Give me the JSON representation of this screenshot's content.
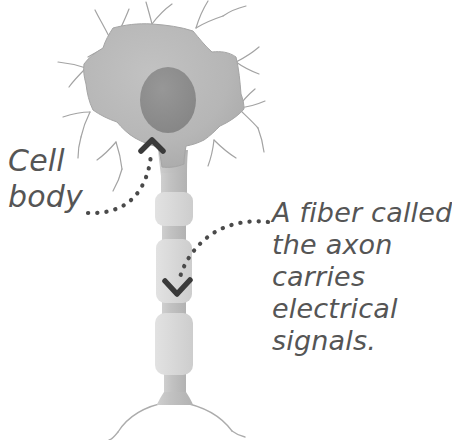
{
  "diagram": {
    "background_color": "#ffffff",
    "labels": {
      "cell_body": {
        "name": "cell-body-label",
        "lines": [
          "Cell",
          "body"
        ],
        "text": "Cell body",
        "color": "#555555",
        "points_to": "soma"
      },
      "axon": {
        "name": "axon-label",
        "lines": [
          "A fiber called",
          "the axon",
          "carries",
          "electrical",
          "signals."
        ],
        "text": "A fiber called the axon carries electrical signals.",
        "color": "#555555",
        "points_to": "axon"
      }
    },
    "parts": {
      "soma": {
        "label": "cell body",
        "fill_color": "#b6b6b6",
        "outline_color": "#9a9a9a"
      },
      "nucleus": {
        "label": "nucleus",
        "fill_color": "#8c8c8c"
      },
      "dendrites": {
        "label": "dendrites",
        "stroke_color": "#a0a0a0"
      },
      "axon": {
        "label": "axon",
        "fill_color": "#c2c2c2"
      },
      "myelin_sheath": {
        "label": "myelin sheath segments",
        "fill_color": "#dadada",
        "segment_count": 3
      },
      "axon_terminals": {
        "label": "axon terminals",
        "stroke_color": "#a8a8a8"
      }
    },
    "leaders": {
      "cell_body_leader": {
        "name": "cell-body-leader",
        "style": "dotted",
        "dot_color": "#4a4a4a",
        "arrow_direction": "up"
      },
      "axon_leader": {
        "name": "axon-leader",
        "style": "dotted",
        "dot_color": "#4a4a4a",
        "arrow_direction": "down"
      }
    }
  }
}
